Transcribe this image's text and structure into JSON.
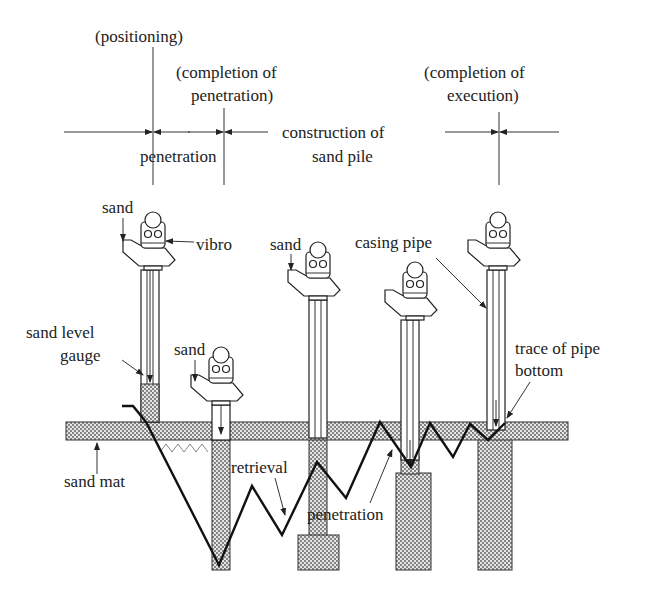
{
  "diagram": {
    "timeline": {
      "milestones": [
        {
          "id": "positioning",
          "label": "(positioning)"
        },
        {
          "id": "completion-penetration",
          "label_line1": "(completion of",
          "label_line2": "penetration)"
        },
        {
          "id": "completion-execution",
          "label_line1": "(completion of",
          "label_line2": "execution)"
        }
      ],
      "phases": [
        {
          "id": "penetration",
          "label": "penetration"
        },
        {
          "id": "construction",
          "label_line1": "construction of",
          "label_line2": "sand pile"
        }
      ]
    },
    "labels": {
      "sand_1": "sand",
      "sand_2": "sand",
      "sand_3": "sand",
      "vibro": "vibro",
      "casing_pipe": "casing pipe",
      "sand_level_gauge_line1": "sand level",
      "sand_level_gauge_line2": "gauge",
      "trace_line1": "trace of pipe",
      "trace_line2": "bottom",
      "sand_mat": "sand mat",
      "retrieval": "retrieval",
      "penetration_bottom": "penetration"
    },
    "stages": [
      {
        "step": 1,
        "name": "positioning"
      },
      {
        "step": 2,
        "name": "penetration"
      },
      {
        "step": 3,
        "name": "retrieval"
      },
      {
        "step": 4,
        "name": "re-penetration"
      },
      {
        "step": 5,
        "name": "completion"
      }
    ],
    "colors": {
      "line": "#222222",
      "sand_fill": "#bdbdbd",
      "background": "#ffffff"
    }
  }
}
